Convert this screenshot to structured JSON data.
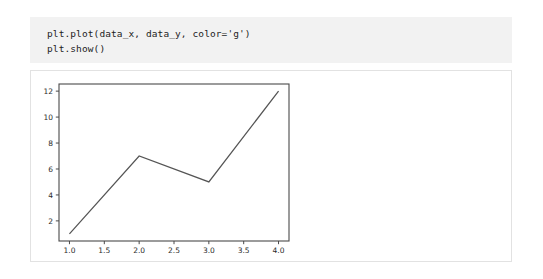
{
  "code_cell": {
    "lines": [
      "plt.plot(data_x, data_y, color='g')",
      "plt.show()"
    ],
    "background_color": "#f2f2f2"
  },
  "output_card": {
    "background_color": "#ffffff",
    "border_color": "#e2e2e2"
  },
  "chart_data": {
    "type": "line",
    "title": "",
    "xlabel": "",
    "ylabel": "",
    "x": [
      1,
      2,
      3,
      4
    ],
    "values": [
      1,
      7,
      5,
      12
    ],
    "series": [
      {
        "name": "data_y",
        "x": [
          1,
          2,
          3,
          4
        ],
        "values": [
          1,
          7,
          5,
          12
        ],
        "color": "#555555",
        "requested_color": "g"
      }
    ],
    "xlim": [
      0.85,
      4.15
    ],
    "ylim": [
      0.45,
      12.55
    ],
    "xticks": [
      1.0,
      1.5,
      2.0,
      2.5,
      3.0,
      3.5,
      4.0
    ],
    "xtick_labels": [
      "1.0",
      "1.5",
      "2.0",
      "2.5",
      "3.0",
      "3.5",
      "4.0"
    ],
    "yticks": [
      2,
      4,
      6,
      8,
      10,
      12
    ],
    "ytick_labels": [
      "2",
      "4",
      "6",
      "8",
      "10",
      "12"
    ],
    "grid": false,
    "legend": false,
    "frame_color": "#4a4a4a",
    "plot_background": "#ffffff"
  }
}
